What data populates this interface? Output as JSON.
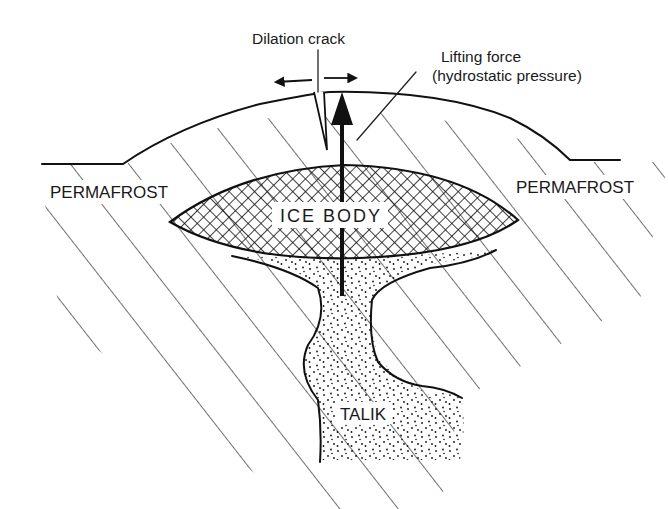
{
  "diagram": {
    "labels": {
      "dilation_crack": "Dilation crack",
      "lifting_force_line1": "Lifting force",
      "lifting_force_line2": "(hydrostatic pressure)",
      "permafrost_left": "PERMAFROST",
      "permafrost_right": "PERMAFROST",
      "ice_body": "ICE BODY",
      "talik": "TALIK"
    },
    "regions": [
      {
        "name": "permafrost",
        "pattern": "diagonal-hatch"
      },
      {
        "name": "ice-body",
        "pattern": "cross-hatch"
      },
      {
        "name": "talik",
        "pattern": "stipple"
      }
    ],
    "arrows": [
      {
        "name": "lifting-force-arrow",
        "direction": "up"
      },
      {
        "name": "crack-spread-left-arrow",
        "direction": "left"
      },
      {
        "name": "crack-spread-right-arrow",
        "direction": "right"
      }
    ],
    "colors": {
      "ink": "#111111",
      "background": "#ffffff"
    }
  }
}
